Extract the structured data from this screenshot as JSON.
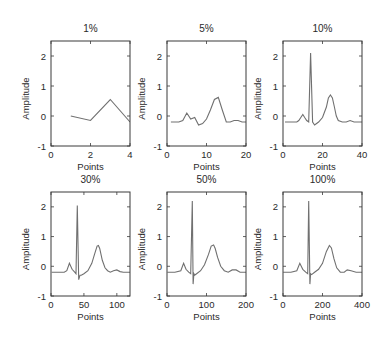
{
  "chart_data": [
    {
      "type": "line",
      "title": "1%",
      "xlabel": "Points",
      "ylabel": "Amplitude",
      "xlim": [
        0,
        4
      ],
      "ylim": [
        -1,
        2.5
      ],
      "xticks": [
        0,
        2,
        4
      ],
      "yticks": [
        -1,
        0,
        1,
        2
      ],
      "grid": false,
      "x": [
        1,
        2,
        3,
        4
      ],
      "y": [
        0.0,
        -0.15,
        0.55,
        -0.2
      ]
    },
    {
      "type": "line",
      "title": "5%",
      "xlabel": "Points",
      "ylabel": "Amplitude",
      "xlim": [
        0,
        20
      ],
      "ylim": [
        -1,
        2.5
      ],
      "xticks": [
        0,
        10,
        20
      ],
      "yticks": [
        -1,
        0,
        1,
        2
      ],
      "grid": false,
      "x": [
        1,
        2,
        3,
        4,
        5,
        6,
        7,
        8,
        9,
        10,
        11,
        12,
        13,
        14,
        15,
        16,
        17,
        18,
        19,
        20
      ],
      "y": [
        -0.2,
        -0.2,
        -0.2,
        -0.15,
        0.1,
        -0.1,
        -0.05,
        -0.3,
        -0.25,
        -0.1,
        0.2,
        0.55,
        0.62,
        0.2,
        -0.2,
        -0.2,
        -0.15,
        -0.15,
        -0.2,
        -0.2
      ]
    },
    {
      "type": "line",
      "title": "10%",
      "xlabel": "Points",
      "ylabel": "Amplitude",
      "xlim": [
        0,
        40
      ],
      "ylim": [
        -1,
        2.5
      ],
      "xticks": [
        0,
        20,
        40
      ],
      "yticks": [
        -1,
        0,
        1,
        2
      ],
      "grid": false,
      "x": [
        1,
        4,
        7,
        8,
        9,
        10,
        11,
        12,
        13,
        14,
        15,
        16,
        17,
        18,
        20,
        22,
        23,
        24,
        25,
        26,
        27,
        28,
        30,
        32,
        34,
        36,
        38,
        40
      ],
      "y": [
        -0.2,
        -0.2,
        -0.2,
        -0.15,
        -0.05,
        0.05,
        -0.05,
        -0.15,
        -0.2,
        2.1,
        -0.2,
        -0.3,
        -0.25,
        -0.2,
        -0.05,
        0.3,
        0.6,
        0.7,
        0.6,
        0.3,
        0.0,
        -0.15,
        -0.2,
        -0.2,
        -0.15,
        -0.2,
        -0.2,
        -0.2
      ]
    },
    {
      "type": "line",
      "title": "30%",
      "xlabel": "Points",
      "ylabel": "Amplitude",
      "xlim": [
        0,
        120
      ],
      "ylim": [
        -1,
        2.5
      ],
      "xticks": [
        0,
        50,
        100
      ],
      "yticks": [
        -1,
        0,
        1,
        2
      ],
      "grid": false,
      "x": [
        1,
        10,
        20,
        24,
        28,
        32,
        36,
        38,
        40,
        42,
        44,
        46,
        50,
        56,
        62,
        66,
        70,
        72,
        74,
        78,
        82,
        86,
        90,
        95,
        100,
        105,
        110,
        120
      ],
      "y": [
        -0.2,
        -0.2,
        -0.2,
        -0.15,
        0.1,
        -0.1,
        -0.2,
        -0.25,
        2.05,
        -0.45,
        -0.3,
        -0.3,
        -0.25,
        -0.15,
        0.1,
        0.4,
        0.68,
        0.7,
        0.6,
        0.2,
        -0.05,
        -0.15,
        -0.2,
        -0.15,
        -0.12,
        -0.18,
        -0.2,
        -0.2
      ]
    },
    {
      "type": "line",
      "title": "50%",
      "xlabel": "Points",
      "ylabel": "Amplitude",
      "xlim": [
        0,
        200
      ],
      "ylim": [
        -1,
        2.5
      ],
      "xticks": [
        0,
        100,
        200
      ],
      "yticks": [
        -1,
        0,
        1,
        2
      ],
      "grid": false,
      "x": [
        1,
        20,
        35,
        42,
        48,
        55,
        60,
        64,
        66,
        68,
        70,
        75,
        85,
        95,
        105,
        112,
        118,
        122,
        128,
        136,
        145,
        155,
        165,
        175,
        185,
        200
      ],
      "y": [
        -0.2,
        -0.2,
        -0.15,
        0.1,
        -0.1,
        -0.2,
        -0.25,
        2.2,
        -0.6,
        -0.25,
        -0.3,
        -0.25,
        -0.15,
        0.05,
        0.4,
        0.68,
        0.72,
        0.6,
        0.3,
        0.0,
        -0.15,
        -0.2,
        -0.12,
        -0.12,
        -0.2,
        -0.2
      ]
    },
    {
      "type": "line",
      "title": "100%",
      "xlabel": "Points",
      "ylabel": "Amplitude",
      "xlim": [
        0,
        400
      ],
      "ylim": [
        -1,
        2.5
      ],
      "xticks": [
        0,
        200,
        400
      ],
      "yticks": [
        -1,
        0,
        1,
        2
      ],
      "grid": false,
      "x": [
        1,
        40,
        70,
        85,
        100,
        115,
        125,
        130,
        136,
        140,
        145,
        160,
        180,
        200,
        220,
        235,
        245,
        258,
        272,
        290,
        310,
        325,
        345,
        370,
        400
      ],
      "y": [
        -0.2,
        -0.2,
        -0.15,
        0.1,
        -0.1,
        -0.2,
        -0.25,
        2.2,
        -0.6,
        -0.25,
        -0.28,
        -0.2,
        -0.1,
        0.1,
        0.5,
        0.7,
        0.62,
        0.25,
        -0.05,
        -0.2,
        -0.2,
        -0.12,
        -0.15,
        -0.2,
        -0.2
      ]
    }
  ],
  "style": {
    "line_color": "#707070",
    "axis_color": "#3a3a3a",
    "background": "#ffffff"
  }
}
